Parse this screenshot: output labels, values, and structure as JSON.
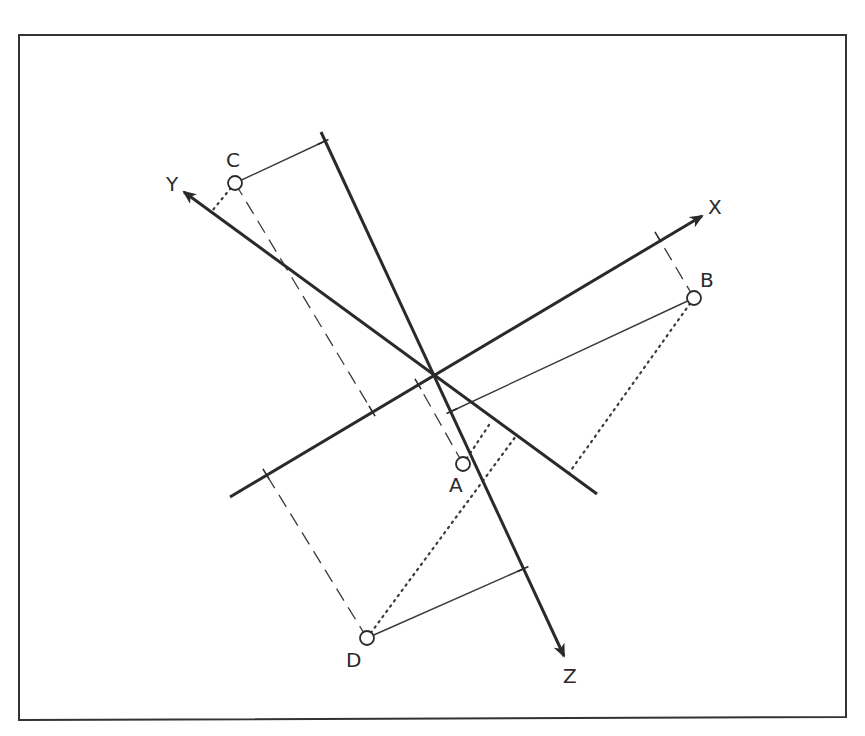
{
  "diagram": {
    "type": "3d-coordinate-projection",
    "frame": {
      "stroke": "#333333",
      "corners": [
        [
          19,
          35
        ],
        [
          846,
          35
        ],
        [
          846,
          717
        ],
        [
          19,
          720
        ]
      ]
    },
    "origin": [
      433,
      374
    ],
    "axes": [
      {
        "id": "X",
        "label": "X",
        "from": [
          230,
          497
        ],
        "to": [
          702,
          216
        ],
        "label_pos": [
          708,
          214
        ]
      },
      {
        "id": "Y",
        "label": "Y",
        "from": [
          597,
          494
        ],
        "to": [
          184,
          192
        ],
        "label_pos": [
          166,
          191
        ]
      },
      {
        "id": "Z",
        "label": "Z",
        "from": [
          321,
          132
        ],
        "to": [
          564,
          656
        ],
        "label_pos": [
          563,
          683
        ]
      }
    ],
    "points": [
      {
        "id": "A",
        "label": "A",
        "pos": [
          463,
          464
        ],
        "label_pos": [
          449,
          492
        ]
      },
      {
        "id": "B",
        "label": "B",
        "pos": [
          694,
          298
        ],
        "label_pos": [
          700,
          287
        ]
      },
      {
        "id": "C",
        "label": "C",
        "pos": [
          235,
          183
        ],
        "label_pos": [
          226,
          167
        ]
      },
      {
        "id": "D",
        "label": "D",
        "pos": [
          367,
          638
        ],
        "label_pos": [
          346,
          667
        ]
      }
    ],
    "projections": {
      "x_axis_dashed": [
        {
          "point": "C",
          "from": [
            235,
            183
          ],
          "to": [
            372,
            411
          ]
        },
        {
          "point": "B",
          "from": [
            694,
            298
          ],
          "to": [
            658,
            237
          ]
        },
        {
          "point": "A",
          "from": [
            463,
            464
          ],
          "to": [
            418,
            384
          ]
        },
        {
          "point": "D",
          "from": [
            367,
            638
          ],
          "to": [
            266,
            474
          ]
        }
      ],
      "z_axis_solid": [
        {
          "point": "C",
          "from": [
            235,
            183
          ],
          "to": [
            323,
            142
          ]
        },
        {
          "point": "B",
          "from": [
            694,
            298
          ],
          "to": [
            452,
            411
          ]
        },
        {
          "point": "D",
          "from": [
            367,
            638
          ],
          "to": [
            523,
            569
          ]
        }
      ],
      "y_axis_dotted": [
        {
          "point": "C",
          "from": [
            235,
            183
          ],
          "to": [
            212,
            211
          ]
        },
        {
          "point": "B",
          "from": [
            694,
            298
          ],
          "to": [
            569,
            473
          ]
        },
        {
          "point": "A",
          "from": [
            463,
            464
          ],
          "to": [
            491,
            422
          ]
        },
        {
          "point": "D",
          "from": [
            367,
            638
          ],
          "to": [
            516,
            436
          ]
        }
      ]
    },
    "ticks": [
      {
        "on": "X",
        "at": [
          372,
          411
        ]
      },
      {
        "on": "X",
        "at": [
          658,
          237
        ]
      },
      {
        "on": "X",
        "at": [
          418,
          384
        ]
      },
      {
        "on": "X",
        "at": [
          266,
          474
        ]
      },
      {
        "on": "Z",
        "at": [
          323,
          142
        ]
      },
      {
        "on": "Z",
        "at": [
          452,
          411
        ]
      },
      {
        "on": "Z",
        "at": [
          523,
          569
        ]
      }
    ],
    "colors": {
      "axis": "#2a2a2a",
      "projection": "#3a3a3a",
      "point_fill": "#ffffff",
      "background": "#ffffff"
    }
  }
}
